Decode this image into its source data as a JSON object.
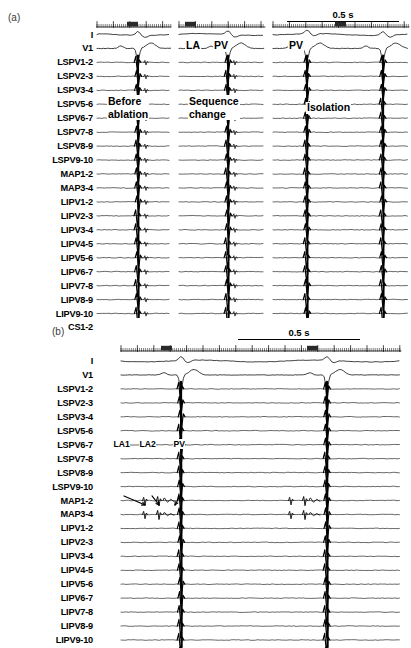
{
  "figure": {
    "panels": [
      {
        "tag": "(a)",
        "scalebar": {
          "label": "0.5 s"
        },
        "channels": [
          "I",
          "V1",
          "LSPV1-2",
          "LSPV2-3",
          "LSPV3-4",
          "LSPV5-6",
          "LSPV6-7",
          "LSPV7-8",
          "LSPV8-9",
          "LSPV9-10",
          "MAP1-2",
          "MAP3-4",
          "LIPV1-2",
          "LIPV2-3",
          "LIPV3-4",
          "LIPV4-5",
          "LIPV5-6",
          "LIPV6-7",
          "LIPV7-8",
          "LIPV8-9",
          "LIPV9-10",
          "CS1-2"
        ],
        "segments": [
          {
            "name": "before-ablation",
            "caption": [
              "Before",
              "ablation"
            ]
          },
          {
            "name": "sequence-change",
            "caption": [
              "Sequence",
              "change"
            ]
          },
          {
            "name": "isolation",
            "caption": [
              "Isolation"
            ]
          }
        ],
        "annotations": [
          {
            "name": "la-marker",
            "text": "LA"
          },
          {
            "name": "pv-marker-mid",
            "text": "PV"
          },
          {
            "name": "pv-marker-right",
            "text": "PV"
          }
        ]
      },
      {
        "tag": "(b)",
        "scalebar": {
          "label": "0.5 s"
        },
        "channels": [
          "I",
          "V1",
          "LSPV1-2",
          "LSPV2-3",
          "LSPV3-4",
          "LSPV5-6",
          "LSPV6-7",
          "LSPV7-8",
          "LSPV8-9",
          "LSPV9-10",
          "MAP1-2",
          "MAP3-4",
          "LIPV1-2",
          "LIPV2-3",
          "LIPV3-4",
          "LIPV4-5",
          "LIPV5-6",
          "LIPV6-7",
          "LIPV7-8",
          "LIPV8-9",
          "LIPV9-10",
          "CS1-2"
        ],
        "annotations": [
          {
            "name": "la1-marker",
            "text": "LA1"
          },
          {
            "name": "la2-marker",
            "text": "LA2"
          },
          {
            "name": "pv-marker",
            "text": "PV"
          }
        ]
      }
    ]
  },
  "colors": {
    "trace": "#000000",
    "background": "#ffffff",
    "tag": "#3a3a3a"
  }
}
